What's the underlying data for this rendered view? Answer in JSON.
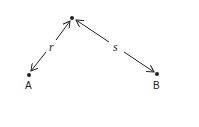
{
  "diagram": {
    "nodes": [
      {
        "id": "top",
        "label": "",
        "x": 72,
        "y": 18
      },
      {
        "id": "A",
        "label": "A",
        "x": 29,
        "y": 75
      },
      {
        "id": "B",
        "label": "B",
        "x": 157,
        "y": 74
      }
    ],
    "edges": [
      {
        "from": "top",
        "to": "A",
        "label": "r",
        "arrows": "both"
      },
      {
        "from": "top",
        "to": "B",
        "label": "s",
        "arrows": "both"
      }
    ],
    "colors": {
      "stroke": "#222222",
      "background": "#ffffff"
    }
  }
}
